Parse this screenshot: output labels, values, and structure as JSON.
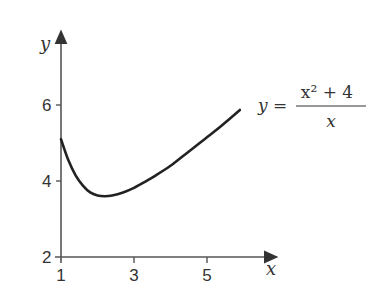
{
  "chart_data": {
    "type": "line",
    "title": "",
    "xlabel": "x",
    "ylabel": "y",
    "xlim": [
      1,
      6.3
    ],
    "ylim": [
      2,
      7.3
    ],
    "x_ticks": [
      1,
      3,
      5
    ],
    "y_ticks": [
      2,
      4,
      6
    ],
    "grid": false,
    "annotation": {
      "lhs": "y =",
      "numerator": "x² + 4",
      "denominator": "x"
    },
    "series": [
      {
        "name": "y = (x^2 + 4)/x",
        "x": [
          1.0,
          1.2,
          1.4,
          1.6,
          1.8,
          2.0,
          2.2,
          2.4,
          2.7,
          3.0,
          3.3,
          3.6,
          4.0,
          4.4,
          4.8,
          5.2,
          5.6,
          5.9
        ],
        "y": [
          5.1,
          4.55,
          4.15,
          3.88,
          3.7,
          3.62,
          3.6,
          3.62,
          3.7,
          3.82,
          3.98,
          4.15,
          4.4,
          4.7,
          5.0,
          5.3,
          5.62,
          5.87
        ]
      }
    ]
  }
}
